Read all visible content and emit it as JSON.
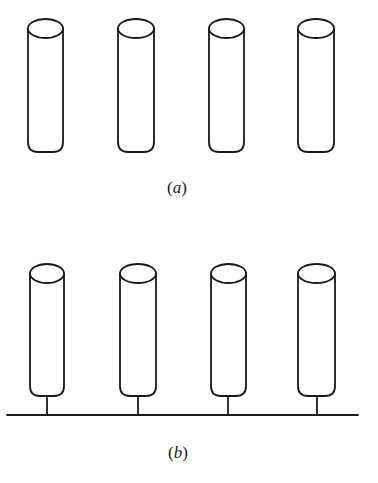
{
  "figure": {
    "panels": [
      {
        "id": "a",
        "caption": {
          "open": "(",
          "letter": "a",
          "close": ")"
        },
        "description": "Four isolated vertical cylinders",
        "cylinders": [
          {
            "x": 28,
            "width": 35,
            "top": 19,
            "bottom": 152
          },
          {
            "x": 118,
            "width": 36,
            "top": 19,
            "bottom": 152
          },
          {
            "x": 209,
            "width": 35,
            "top": 19,
            "bottom": 152
          },
          {
            "x": 298,
            "width": 36,
            "top": 19,
            "bottom": 152
          }
        ],
        "baseline": null
      },
      {
        "id": "b",
        "caption": {
          "open": "(",
          "letter": "b",
          "close": ")"
        },
        "description": "Four vertical cylinders each connected by a stem to a common horizontal baseline",
        "cylinders": [
          {
            "x": 30,
            "width": 34,
            "top": 264,
            "bottom": 396,
            "stem_x": 47
          },
          {
            "x": 120,
            "width": 36,
            "top": 264,
            "bottom": 396,
            "stem_x": 138
          },
          {
            "x": 211,
            "width": 35,
            "top": 264,
            "bottom": 396,
            "stem_x": 228
          },
          {
            "x": 298,
            "width": 37,
            "top": 264,
            "bottom": 396,
            "stem_x": 317
          }
        ],
        "baseline": {
          "x1": 7,
          "x2": 358,
          "y": 415
        }
      }
    ],
    "colors": {
      "line": "#1a1a1a",
      "background": "#ffffff"
    }
  }
}
